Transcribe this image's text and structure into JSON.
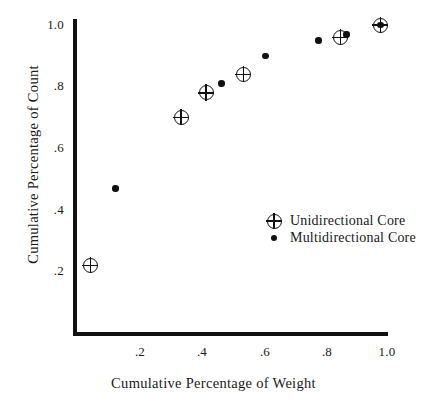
{
  "chart_data": {
    "type": "scatter",
    "title": "",
    "xlabel": "Cumulative Percentage of Weight",
    "ylabel": "Cumulative Percentage of Count",
    "xlim": [
      0.0,
      1.0
    ],
    "ylim": [
      0.0,
      1.0
    ],
    "grid": false,
    "legend_position": "inside-right",
    "xticks": [
      {
        "value": 0.2,
        "label": ".2"
      },
      {
        "value": 0.4,
        "label": ".4"
      },
      {
        "value": 0.6,
        "label": ".6"
      },
      {
        "value": 0.8,
        "label": ".8"
      },
      {
        "value": 1.0,
        "label": "1.0"
      }
    ],
    "yticks": [
      {
        "value": 0.2,
        "label": ".2"
      },
      {
        "value": 0.4,
        "label": ".4"
      },
      {
        "value": 0.6,
        "label": ".6"
      },
      {
        "value": 0.8,
        "label": ".8"
      },
      {
        "value": 1.0,
        "label": "1.0"
      }
    ],
    "series": [
      {
        "name": "Unidirectional Core",
        "marker": "circled-plus",
        "color": "#111111",
        "points": [
          {
            "x": 0.05,
            "y": 0.21
          },
          {
            "x": 0.34,
            "y": 0.69
          },
          {
            "x": 0.42,
            "y": 0.77
          },
          {
            "x": 0.54,
            "y": 0.83
          },
          {
            "x": 0.85,
            "y": 0.95
          },
          {
            "x": 0.98,
            "y": 0.99
          }
        ]
      },
      {
        "name": "Multidirectional Core",
        "marker": "filled-circle",
        "color": "#111111",
        "points": [
          {
            "x": 0.13,
            "y": 0.46
          },
          {
            "x": 0.47,
            "y": 0.8
          },
          {
            "x": 0.61,
            "y": 0.89
          },
          {
            "x": 0.78,
            "y": 0.94
          },
          {
            "x": 0.87,
            "y": 0.96
          },
          {
            "x": 0.98,
            "y": 0.99
          }
        ]
      }
    ]
  },
  "legend": {
    "items": [
      {
        "label": "Unidirectional Core",
        "marker": "circled-plus"
      },
      {
        "label": "Multidirectional Core",
        "marker": "filled-circle"
      }
    ]
  }
}
